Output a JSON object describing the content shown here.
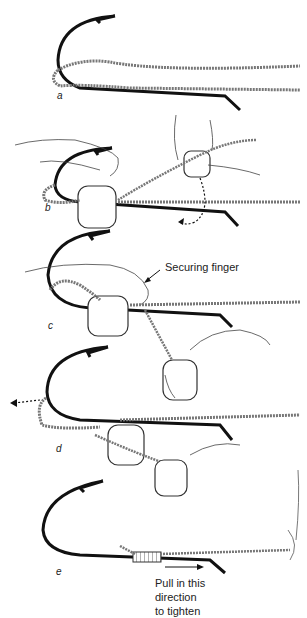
{
  "diagram": {
    "colors": {
      "ink": "#111111",
      "line": "#555555",
      "background": "#ffffff"
    },
    "steps": [
      {
        "id": "a",
        "label": "a"
      },
      {
        "id": "b",
        "label": "b"
      },
      {
        "id": "c",
        "label": "c",
        "annotation": "Securing finger"
      },
      {
        "id": "d",
        "label": "d"
      },
      {
        "id": "e",
        "label": "e",
        "annotation_lines": [
          "Pull in this",
          "direction",
          "to tighten"
        ]
      }
    ]
  }
}
